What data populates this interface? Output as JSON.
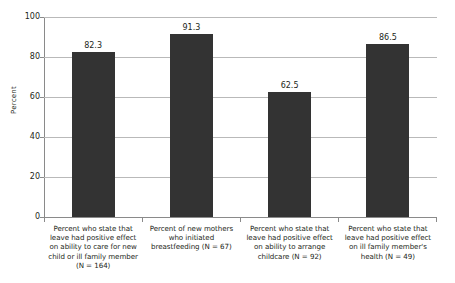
{
  "chart_data": {
    "type": "bar",
    "title": "",
    "subtitle": "",
    "xlabel": "",
    "ylabel": "Percent",
    "ylim": [
      0,
      100
    ],
    "yticks": [
      0,
      20,
      40,
      60,
      80,
      100
    ],
    "grid": true,
    "legend": "none",
    "bar_color": "#333333",
    "gridline_color": "#b9b9b9",
    "axis_color": "#8a8a8a",
    "categories": [
      "Percent who state that leave had positive effect on ability to care for new child or ill family member (N = 164)",
      "Percent of new mothers who initiated breastfeeding (N = 67)",
      "Percent who state that leave had positive effect on ability to arrange childcare (N = 92)",
      "Percent who state that leave had positive effect on ill family member's health (N = 49)"
    ],
    "values": [
      82.3,
      91.3,
      62.5,
      86.5
    ],
    "value_labels": [
      "82.3",
      "91.3",
      "62.5",
      "86.5"
    ],
    "sample_sizes": [
      164,
      67,
      92,
      49
    ]
  },
  "ytick_labels": [
    "100",
    "80",
    "60",
    "40",
    "20",
    "0"
  ]
}
